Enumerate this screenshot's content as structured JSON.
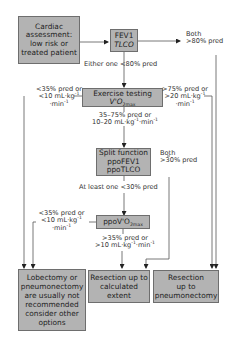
{
  "diagram": {
    "nodes": {
      "cardiac": {
        "lines": [
          "Cardiac",
          "assessment:",
          "low risk or",
          "treated patient"
        ]
      },
      "fev1": {
        "line1": "FEV1",
        "line2": "TLCO"
      },
      "exercise": {
        "line1": "Exercise testing",
        "line2_main": "V'O",
        "line2_sub": "2max"
      },
      "split": {
        "line1": "Split function",
        "line2": "ppoFEV1",
        "line3": "ppoTLCO"
      },
      "ppovo2": {
        "main": "ppoV'O",
        "sub": "2max"
      },
      "not_recommended": {
        "lines": [
          "Lobectomy or",
          "pneumonectomy",
          "are usually not",
          "recommended",
          "consider other",
          "options"
        ]
      },
      "resection_calculated": {
        "lines": [
          "Resection up to",
          "calculated",
          "extent"
        ]
      },
      "resection_pneumonectomy": {
        "lines": [
          "Resection",
          "up to",
          "pneumonectomy"
        ]
      }
    },
    "edge_labels": {
      "both_80": {
        "line1": "Both",
        "line2": ">80% pred"
      },
      "either_80": "Either one <80% pred",
      "ex_low": {
        "line1": "<35% pred or",
        "line2": "<10 mL·kg",
        "line2_sup": "-1",
        "line3": "·min",
        "line3_sup": "-1"
      },
      "ex_high": {
        "line1": ">75% pred or",
        "line2": ">20 mL·kg",
        "line2_sup": "-1",
        "line3": "·min",
        "line3_sup": "-1"
      },
      "ex_mid": {
        "line1": "35–75% pred or",
        "line2": "10–20 mL·kg",
        "line2_sup": "-1",
        "line2b": "·min",
        "line2b_sup": "-1"
      },
      "both_30": {
        "line1": "Both",
        "line2": ">30% pred"
      },
      "atleast_30": "At least one <30% pred",
      "ppo_low": {
        "line1": "<35% pred  or",
        "line2": "<10 mL·kg",
        "line2_sup": "-1",
        "line3": "·min",
        "line3_sup": "-1"
      },
      "ppo_high": {
        "line1": ">35% pred or",
        "line2": ">10 mL·kg",
        "line2_sup": "-1",
        "line2b": "·min",
        "line2b_sup": "-1"
      }
    },
    "colors": {
      "box_fill": "#b3b3b3",
      "box_border": "#6e6e6e",
      "line": "#555555",
      "text": "#2a2a2a"
    }
  }
}
